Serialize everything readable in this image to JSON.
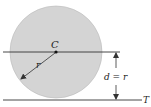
{
  "diagram": {
    "center_label": "C",
    "radius_label": "r",
    "distance_label": "d = r",
    "tangent_label": "T",
    "colors": {
      "circle_fill": "#d4d4d4",
      "circle_stroke": "#b0b0b0",
      "line": "#333333"
    }
  }
}
